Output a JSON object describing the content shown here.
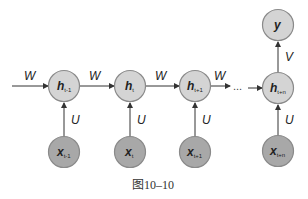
{
  "diagram": {
    "type": "unrolled-rnn",
    "hidden_nodes": [
      {
        "id": "h_t-1",
        "label": "h",
        "subscript": "t-1"
      },
      {
        "id": "h_t",
        "label": "h",
        "subscript": "t"
      },
      {
        "id": "h_t+1",
        "label": "h",
        "subscript": "t+1"
      },
      {
        "id": "h_t+n",
        "label": "h",
        "subscript": "t+n"
      }
    ],
    "input_nodes": [
      {
        "id": "x_t-1",
        "label": "x",
        "subscript": "t-1"
      },
      {
        "id": "x_t",
        "label": "x",
        "subscript": "t"
      },
      {
        "id": "x_t+1",
        "label": "x",
        "subscript": "t+1"
      },
      {
        "id": "x_t+n",
        "label": "x",
        "subscript": "t+n"
      }
    ],
    "output_node": {
      "id": "y",
      "label": "y"
    },
    "edge_labels": {
      "recurrent": "W",
      "input": "U",
      "output": "V"
    },
    "ellipsis": "...",
    "caption": "图10–10",
    "colors": {
      "hidden_fill": "#d4d4d4",
      "input_fill": "#a8a8a8",
      "stroke": "#8a8a8a",
      "edge": "#333333"
    }
  }
}
